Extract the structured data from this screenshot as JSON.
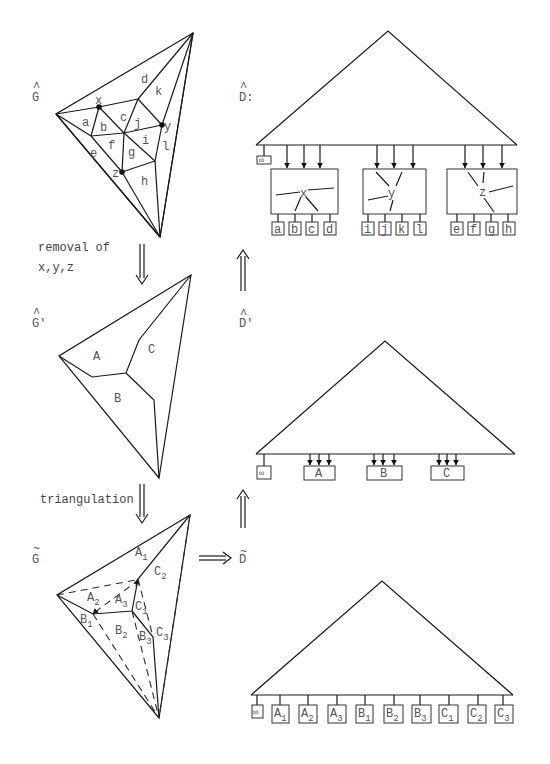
{
  "labels": {
    "g_hat": "G",
    "d_hat": "D:",
    "g_hat_prime": "G'",
    "d_hat_prime": "D'",
    "g_tilde": "G",
    "d_tilde": "D",
    "hat_mark": "^",
    "tilde_mark": "~"
  },
  "captions": {
    "removal_line1": "removal of",
    "removal_line2": "x,y,z",
    "triangulation": "triangulation"
  },
  "stage1": {
    "vertices": {
      "x": "x",
      "y": "y",
      "z": "z"
    },
    "faces": [
      "a",
      "b",
      "c",
      "d",
      "e",
      "f",
      "g",
      "h",
      "i",
      "j",
      "k",
      "l"
    ]
  },
  "stage2": {
    "faces": [
      "A",
      "B",
      "C"
    ]
  },
  "stage3": {
    "faces": [
      {
        "base": "A",
        "sub": "1"
      },
      {
        "base": "A",
        "sub": "2"
      },
      {
        "base": "A",
        "sub": "3"
      },
      {
        "base": "B",
        "sub": "1"
      },
      {
        "base": "B",
        "sub": "2"
      },
      {
        "base": "B",
        "sub": "3"
      },
      {
        "base": "C",
        "sub": "1"
      },
      {
        "base": "C",
        "sub": "2"
      },
      {
        "base": "C",
        "sub": "3"
      }
    ]
  },
  "tree1": {
    "infinity": "∞",
    "groups": [
      {
        "center": "x",
        "leaves": [
          "a",
          "b",
          "c",
          "d"
        ]
      },
      {
        "center": "y",
        "leaves": [
          "i",
          "j",
          "k",
          "l"
        ]
      },
      {
        "center": "z",
        "leaves": [
          "e",
          "f",
          "g",
          "h"
        ]
      }
    ]
  },
  "tree2": {
    "infinity": "∞",
    "leaves": [
      "A",
      "B",
      "C"
    ]
  },
  "tree3": {
    "infinity": "∞",
    "leaves": [
      {
        "base": "A",
        "sub": "1"
      },
      {
        "base": "A",
        "sub": "2"
      },
      {
        "base": "A",
        "sub": "3"
      },
      {
        "base": "B",
        "sub": "1"
      },
      {
        "base": "B",
        "sub": "2"
      },
      {
        "base": "B",
        "sub": "3"
      },
      {
        "base": "C",
        "sub": "1"
      },
      {
        "base": "C",
        "sub": "2"
      },
      {
        "base": "C",
        "sub": "3"
      }
    ]
  }
}
